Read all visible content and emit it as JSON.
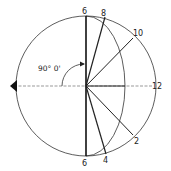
{
  "diagram": {
    "type": "sun-path / hour-line projection",
    "angle_label": "90° 0'",
    "labels": {
      "top": "6",
      "bottom": "6",
      "h8": "8",
      "h10": "10",
      "h12": "12",
      "h2": "2",
      "h4": "4"
    },
    "colors": {
      "line": "#222222",
      "background": "#ffffff"
    }
  }
}
